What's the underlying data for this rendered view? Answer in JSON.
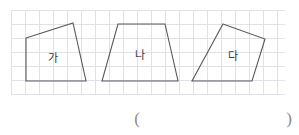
{
  "figure": {
    "background_color": "#ffffff",
    "grid": {
      "name": "graph-paper-grid",
      "line_color": "#c9c9d6",
      "cell_size_px": 14,
      "left_px": 11,
      "top_px": 10,
      "width_px": 274,
      "height_px": 85
    },
    "stroke_color": "#5a5a5a",
    "label_color": "#3a3a3a",
    "paren_color": "#8a8a8a"
  },
  "shapes": [
    {
      "label": "가",
      "name": "quadrilateral-ga",
      "type": "quadrilateral",
      "points": "26,38 73,23 86,81 26,81",
      "label_x": 53,
      "label_y": 58
    },
    {
      "label": "나",
      "name": "trapezoid-na",
      "type": "trapezoid",
      "points": "118,24 165,24 178,81 102,81",
      "label_x": 140,
      "label_y": 55
    },
    {
      "label": "다",
      "name": "quadrilateral-da",
      "type": "quadrilateral",
      "points": "223,24 265,39 252,81 192,81",
      "label_x": 233,
      "label_y": 56
    }
  ],
  "answer_blank": {
    "name": "answer-parentheses",
    "open": "(",
    "close": ")",
    "open_x": 137,
    "open_y": 118,
    "close_x": 289,
    "close_y": 118
  }
}
